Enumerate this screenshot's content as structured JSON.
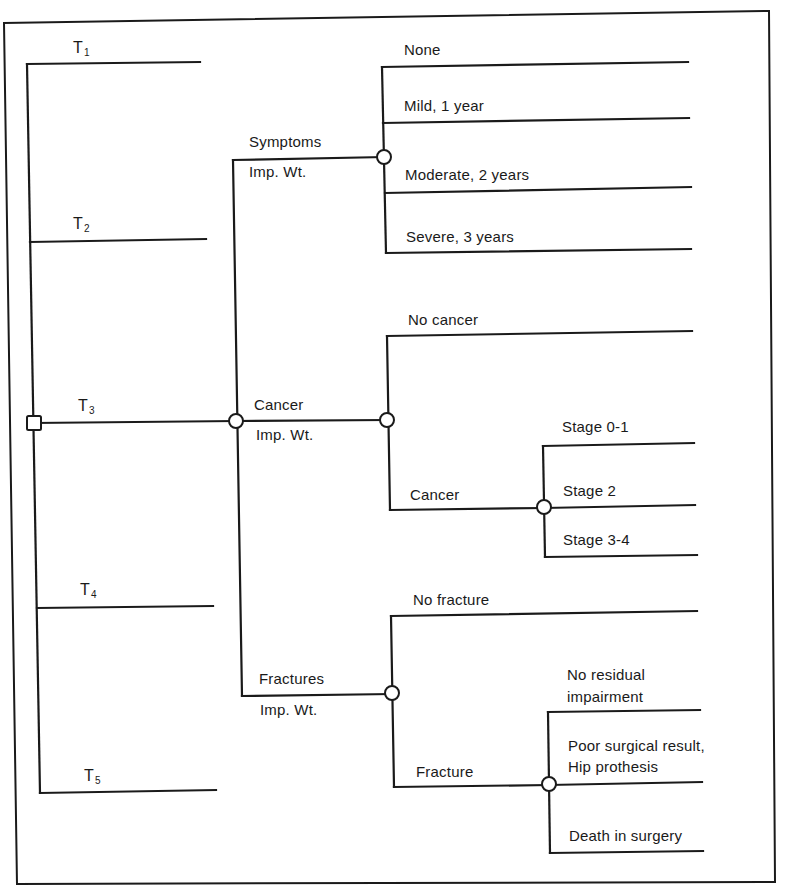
{
  "diagram": {
    "type": "decision-tree",
    "decision_node": {
      "label": "",
      "shape": "square"
    },
    "treatments": [
      {
        "letter": "T",
        "sub": "1"
      },
      {
        "letter": "T",
        "sub": "2"
      },
      {
        "letter": "T",
        "sub": "3"
      },
      {
        "letter": "T",
        "sub": "4"
      },
      {
        "letter": "T",
        "sub": "5"
      }
    ],
    "attributes": [
      {
        "name": "Symptoms",
        "weight_label": "Imp. Wt.",
        "outcomes": [
          "None",
          "Mild, 1 year",
          "Moderate, 2 years",
          "Severe, 3 years"
        ]
      },
      {
        "name": "Cancer",
        "weight_label": "Imp. Wt.",
        "outcomes": [
          "No cancer",
          "Cancer"
        ],
        "sub_outcomes": {
          "parent": "Cancer",
          "items": [
            "Stage 0-1",
            "Stage 2",
            "Stage 3-4"
          ]
        }
      },
      {
        "name": "Fractures",
        "weight_label": "Imp. Wt.",
        "outcomes": [
          "No fracture",
          "Fracture"
        ],
        "sub_outcomes": {
          "parent": "Fracture",
          "items": [
            {
              "line1": "No residual",
              "line2": "impairment"
            },
            {
              "line1": "Poor surgical result,",
              "line2": "Hip prothesis"
            },
            {
              "line1": "Death in surgery",
              "line2": ""
            }
          ]
        }
      }
    ],
    "colors": {
      "stroke": "#1a1a1a",
      "background": "#ffffff"
    }
  }
}
